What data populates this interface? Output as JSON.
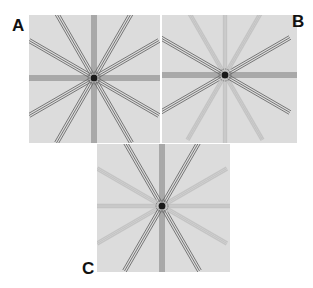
{
  "figure": {
    "panels": [
      {
        "label": "A",
        "description": "12 radial spokes, all full contrast",
        "spoke_angles_deg": [
          0,
          30,
          60,
          90,
          120,
          150,
          180,
          210,
          240,
          270,
          300,
          330
        ],
        "strong_angles_deg": [
          0,
          30,
          60,
          90,
          120,
          150,
          180,
          210,
          240,
          270,
          300,
          330
        ]
      },
      {
        "label": "B",
        "description": "12 radial spokes, horizontal-oriented spokes full contrast, others faint",
        "spoke_angles_deg": [
          0,
          30,
          60,
          90,
          120,
          150,
          180,
          210,
          240,
          270,
          300,
          330
        ],
        "strong_angles_deg": [
          0,
          30,
          150,
          180,
          210,
          330
        ]
      },
      {
        "label": "C",
        "description": "12 radial spokes, vertical-oriented spokes full contrast, others faint",
        "spoke_angles_deg": [
          0,
          30,
          60,
          90,
          120,
          150,
          180,
          210,
          240,
          270,
          300,
          330
        ],
        "strong_angles_deg": [
          60,
          90,
          120,
          240,
          270,
          300
        ]
      }
    ],
    "colors": {
      "background": "#dcdcdc",
      "strong_line": "#6a6a6a",
      "faint_line": "#c4c4c4",
      "center": "#1a1a1a"
    }
  }
}
